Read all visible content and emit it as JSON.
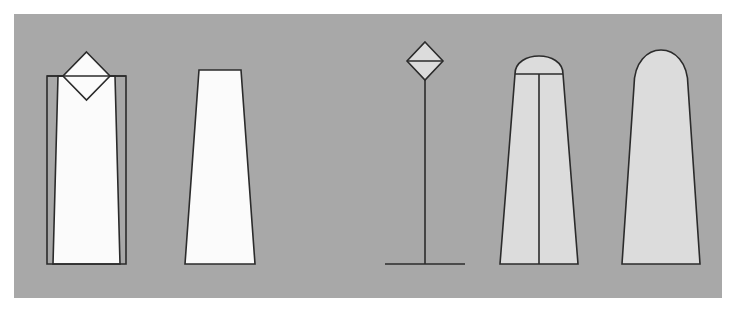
{
  "canvas": {
    "width": 738,
    "height": 320,
    "background_color": "#ffffff"
  },
  "panel": {
    "label": "figure-panel",
    "x": 14,
    "y": 14,
    "width": 708,
    "height": 284,
    "background_color": "#a8a8a8"
  },
  "style": {
    "outline_color": "#2b2b2b",
    "white_fill": "#fbfbfb",
    "light_gray_fill": "#dcdcdc",
    "stroke_width": 1.6
  },
  "figures": [
    {
      "index": 1,
      "name": "boxed-taper-with-diamond",
      "description": "Rectangular outline enclosing a white tapered profile, overlaid by a diamond at the top",
      "fill": "#fbfbfb",
      "has_diamond": true,
      "has_center_line": false,
      "bounding_box": {
        "x": 33,
        "y": 38,
        "width": 94,
        "height": 212
      },
      "box_points": "33,62 112,62 112,250 33,250",
      "profile_points": "44,62 101,62 106,250 39,250",
      "diamond_points": "72.5,38 96,62 72.5,86 49,62",
      "cap_line": "33,62 112,62"
    },
    {
      "index": 2,
      "name": "plain-taper",
      "description": "White trapezoidal profile, flat top, wider at base",
      "fill": "#fbfbfb",
      "has_diamond": false,
      "has_center_line": false,
      "bounding_box": {
        "x": 171,
        "y": 56,
        "width": 70,
        "height": 194
      },
      "profile_points": "185,56 227,56 241,250 171,250"
    },
    {
      "index": 3,
      "name": "diamond-on-pole",
      "description": "Small light-gray diamond with horizontal divider, mounted on a vertical pole with a horizontal base line",
      "fill": "#dcdcdc",
      "has_diamond": true,
      "has_center_line": true,
      "bounding_box": {
        "x": 371,
        "y": 28,
        "width": 80,
        "height": 222
      },
      "diamond_points": "411,28 429,47 411,66 393,47",
      "diamond_divider": "393,47 429,47",
      "pole_line": "411,47 411,250",
      "base_line": "371,250 451,250"
    },
    {
      "index": 4,
      "name": "domed-taper-split",
      "description": "Light-gray tapered profile with domed top, a horizontal cap line and a full-height vertical center line",
      "fill": "#dcdcdc",
      "has_diamond": false,
      "has_center_line": true,
      "bounding_box": {
        "x": 486,
        "y": 28,
        "width": 78,
        "height": 222
      },
      "profile_path": "M 501,60 C 501,36 549,36 549,60 L 564,250 L 486,250 Z",
      "cap_line": "501,60 549,60",
      "center_line": "525,60 525,250"
    },
    {
      "index": 5,
      "name": "domed-taper-plain",
      "description": "Light-gray tapered profile with a tall rounded dome top, no internal lines",
      "fill": "#dcdcdc",
      "has_diamond": false,
      "has_center_line": false,
      "bounding_box": {
        "x": 608,
        "y": 28,
        "width": 78,
        "height": 222
      },
      "profile_path": "M 620,72 C 620,24 674,24 674,72 L 686,250 L 608,250 Z"
    }
  ]
}
